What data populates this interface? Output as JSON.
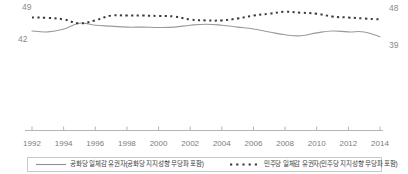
{
  "chart_data": {
    "type": "line",
    "title": "",
    "subtitle": "",
    "xlabel": "",
    "ylabel": "",
    "grid": false,
    "legend_position": "bottom",
    "ylim": [
      30,
      55
    ],
    "xlim": [
      1992,
      2014
    ],
    "x": [
      1992,
      1993,
      1994,
      1995,
      1996,
      1997,
      1998,
      1999,
      2000,
      2001,
      2002,
      2003,
      2004,
      2005,
      2006,
      2007,
      2008,
      2009,
      2010,
      2011,
      2012,
      2013,
      2014
    ],
    "xticks": [
      "1992",
      "1994",
      "1996",
      "1998",
      "2000",
      "2002",
      "2004",
      "2006",
      "2008",
      "2010",
      "2012",
      "2014"
    ],
    "series": [
      {
        "name": "공화당 일체감 유권자(공화당 지지성향 무당파 포함)",
        "style": "solid",
        "color": "#9a9a9a",
        "values": [
          42,
          41.5,
          43,
          46,
          45,
          44.5,
          44,
          44,
          43.8,
          44,
          45,
          45.5,
          45,
          44,
          43,
          41.5,
          40,
          39.5,
          41,
          42,
          41.5,
          41.5,
          39
        ],
        "start_label": "42",
        "end_label": "39"
      },
      {
        "name": "민주당 일체감 유권자(민주당 지지성향 무당파 포함)",
        "style": "dotted",
        "color": "#3a3a3a",
        "values": [
          49,
          48.8,
          48,
          46,
          47.5,
          50,
          50,
          50,
          49.8,
          49.5,
          48,
          47.5,
          47.5,
          48.5,
          50,
          51,
          52,
          51.5,
          51,
          49.5,
          49,
          48.5,
          48
        ],
        "start_label": "49",
        "end_label": "48"
      }
    ],
    "endpoint_labels": {
      "dem_start": "49",
      "dem_end": "48",
      "gop_start": "42",
      "gop_end": "39"
    }
  },
  "legend": {
    "entries": [
      {
        "label": "공화당 일체감 유권자(공화당 지지성향 무당파 포함)",
        "style": "solid"
      },
      {
        "label": "민주당 일체감 유권자(민주당 지지성향 무당파 포함)",
        "style": "dotted"
      }
    ]
  },
  "axis": {
    "ticks": [
      "1992",
      "1994",
      "1996",
      "1998",
      "2000",
      "2002",
      "2004",
      "2006",
      "2008",
      "2010",
      "2012",
      "2014"
    ]
  }
}
